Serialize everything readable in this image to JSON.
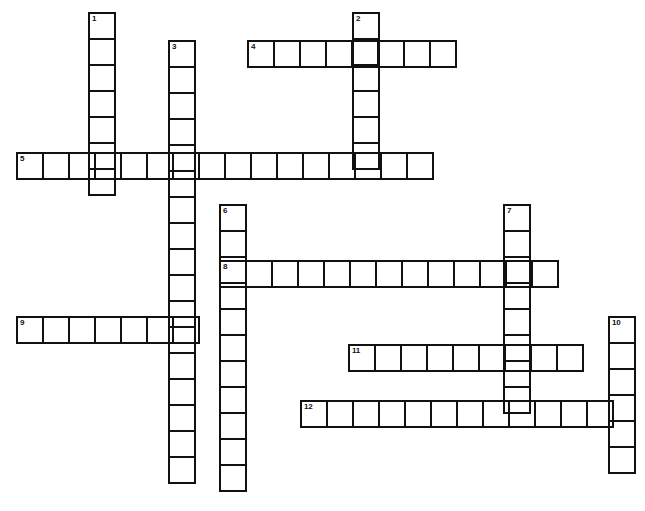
{
  "page": {
    "width": 645,
    "height": 511,
    "background_color": "#ffffff",
    "line_color": "#111111",
    "cell_size": 28,
    "border_width": 2,
    "number_font_size": 8
  },
  "grid": {
    "origin_x": 16,
    "origin_y": 12,
    "columns": 23,
    "rows": 18,
    "total_entries": 12,
    "across_count": 6,
    "down_count": 6
  },
  "entries": [
    {
      "number": "1",
      "direction": "down",
      "length": 7,
      "x": 88,
      "y": 12,
      "cells": [
        "",
        "",
        "",
        "",
        "",
        "",
        ""
      ]
    },
    {
      "number": "2",
      "direction": "down",
      "length": 6,
      "x": 352,
      "y": 12,
      "cells": [
        "",
        "",
        "",
        "",
        "",
        ""
      ]
    },
    {
      "number": "3",
      "direction": "down",
      "length": 17,
      "x": 168,
      "y": 40,
      "cells": [
        "",
        "",
        "",
        "",
        "",
        "",
        "",
        "",
        "",
        "",
        "",
        "",
        "",
        "",
        "",
        "",
        ""
      ]
    },
    {
      "number": "4",
      "direction": "across",
      "length": 8,
      "x": 247,
      "y": 40,
      "cells": [
        "",
        "",
        "",
        "",
        "",
        "",
        "",
        ""
      ]
    },
    {
      "number": "5",
      "direction": "across",
      "length": 16,
      "x": 16,
      "y": 152,
      "cells": [
        "",
        "",
        "",
        "",
        "",
        "",
        "",
        "",
        "",
        "",
        "",
        "",
        "",
        "",
        "",
        ""
      ]
    },
    {
      "number": "6",
      "direction": "down",
      "length": 11,
      "x": 219,
      "y": 204,
      "cells": [
        "",
        "",
        "",
        "",
        "",
        "",
        "",
        "",
        "",
        "",
        ""
      ]
    },
    {
      "number": "7",
      "direction": "down",
      "length": 8,
      "x": 503,
      "y": 204,
      "cells": [
        "",
        "",
        "",
        "",
        "",
        "",
        "",
        ""
      ]
    },
    {
      "number": "8",
      "direction": "across",
      "length": 13,
      "x": 219,
      "y": 260,
      "cells": [
        "",
        "",
        "",
        "",
        "",
        "",
        "",
        "",
        "",
        "",
        "",
        "",
        ""
      ]
    },
    {
      "number": "9",
      "direction": "across",
      "length": 7,
      "x": 16,
      "y": 316,
      "cells": [
        "",
        "",
        "",
        "",
        "",
        "",
        ""
      ]
    },
    {
      "number": "10",
      "direction": "down",
      "length": 6,
      "x": 608,
      "y": 316,
      "cells": [
        "",
        "",
        "",
        "",
        "",
        ""
      ]
    },
    {
      "number": "11",
      "direction": "across",
      "length": 9,
      "x": 348,
      "y": 344,
      "cells": [
        "",
        "",
        "",
        "",
        "",
        "",
        "",
        "",
        ""
      ]
    },
    {
      "number": "12",
      "direction": "across",
      "length": 12,
      "x": 300,
      "y": 400,
      "cells": [
        "",
        "",
        "",
        "",
        "",
        "",
        "",
        "",
        "",
        "",
        "",
        ""
      ]
    }
  ]
}
